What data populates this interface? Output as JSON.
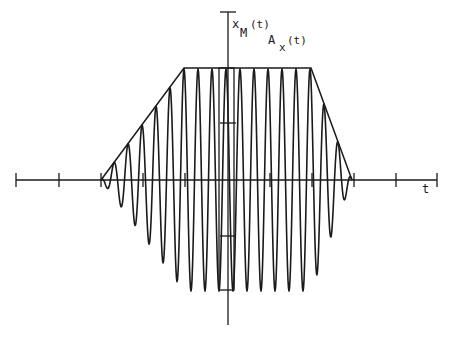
{
  "figure": {
    "width": 451,
    "height": 339,
    "ink_color": "#1a1a1a",
    "background": "#ffffff",
    "labels": {
      "y_axis_signal": "x",
      "y_axis_signal_sub": "M",
      "y_axis_signal_arg": "(t)",
      "envelope": "A",
      "envelope_sub": "x",
      "envelope_arg": "(t)",
      "x_axis": "t"
    }
  },
  "chart_data": {
    "type": "line",
    "title": "",
    "xlabel": "t",
    "ylabel": "x_M(t), A_x(t)",
    "grid": false,
    "legend": "none",
    "axes": {
      "origin_px": [
        228,
        180
      ],
      "x_axis_px": [
        16,
        437
      ],
      "y_axis_px": [
        12,
        325
      ],
      "x_ticks_px": [
        16,
        59,
        101,
        143,
        185,
        270,
        312,
        354,
        396,
        437
      ],
      "y_ticks_px": [
        12,
        123,
        236
      ]
    },
    "envelope": {
      "name": "A_x(t)",
      "shape": "trapezoid",
      "points_px": [
        [
          101,
          180
        ],
        [
          184,
          68
        ],
        [
          311,
          68
        ],
        [
          352,
          180
        ]
      ]
    },
    "series": [
      {
        "name": "x_M(t)",
        "description": "oscillating signal modulated by trapezoidal envelope",
        "period_px": 14,
        "first_peak_px": 184,
        "amplitude_px": 111,
        "start_px": 101,
        "end_px": 352
      }
    ],
    "marker_box_px": {
      "x": 219,
      "y": 68,
      "width": 15,
      "height": 222
    }
  }
}
